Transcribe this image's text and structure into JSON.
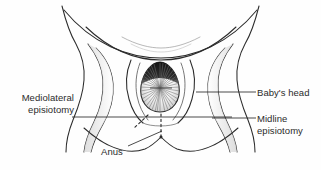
{
  "figure": {
    "kind": "medical-illustration",
    "background_color": "#fefefe",
    "ink_color": "#2b2b2b"
  },
  "labels": {
    "mediolateral_line1": "Mediolateral",
    "mediolateral_line2": "episiotomy",
    "babys_head": "Baby's head",
    "midline_line1": "Midline",
    "midline_line2": "episiotomy",
    "anus": "Anus"
  },
  "annotations": {
    "leader_mediolateral_y": 117,
    "leader_babys_head_y": 92,
    "leader_midline_y": 118,
    "incision_mediolateral_style": "dashed-diagonal",
    "incision_midline_style": "dashed-vertical"
  }
}
